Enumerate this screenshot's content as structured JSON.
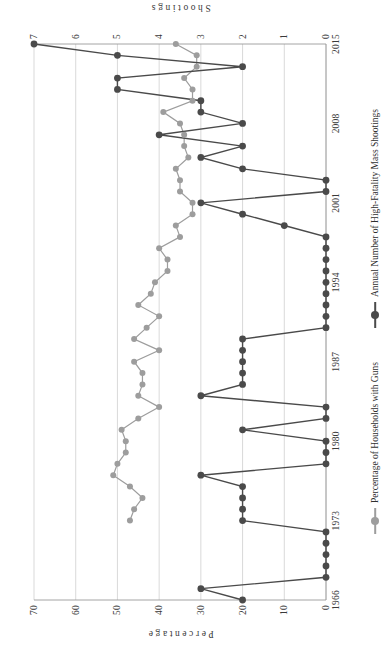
{
  "chart_data": {
    "type": "line",
    "title": "",
    "orientation": "rotated-90",
    "x": [
      1966,
      1967,
      1968,
      1969,
      1970,
      1971,
      1972,
      1973,
      1974,
      1975,
      1976,
      1977,
      1978,
      1979,
      1980,
      1981,
      1982,
      1983,
      1984,
      1985,
      1986,
      1987,
      1988,
      1989,
      1990,
      1991,
      1992,
      1993,
      1994,
      1995,
      1996,
      1997,
      1998,
      1999,
      2000,
      2001,
      2002,
      2003,
      2004,
      2005,
      2006,
      2007,
      2008,
      2009,
      2010,
      2011,
      2012,
      2013,
      2014,
      2015
    ],
    "xlabel": "",
    "xticks": [
      1966,
      1973,
      1980,
      1987,
      1994,
      2001,
      2008,
      2015
    ],
    "grid": true,
    "legend_position": "bottom",
    "series": [
      {
        "name": "Percentage of Households with Guns",
        "axis": "left",
        "color": "#9d9d9d",
        "marker": "circle",
        "ylabel": "Percentage",
        "ylim": [
          0,
          70
        ],
        "yticks": [
          0,
          10,
          20,
          30,
          40,
          50,
          60,
          70
        ],
        "values": [
          null,
          null,
          null,
          null,
          null,
          null,
          null,
          47,
          46,
          44,
          47,
          51,
          50,
          48,
          48,
          49,
          45,
          40,
          45,
          44,
          44,
          46,
          40,
          46,
          43,
          40,
          45,
          42,
          41,
          38,
          38,
          40,
          35,
          36,
          32,
          32,
          35,
          35,
          36,
          33,
          34,
          34,
          35,
          39,
          32,
          32,
          34,
          31,
          31,
          36
        ]
      },
      {
        "name": "Annual Number of High-Fatality Mass Shootings",
        "axis": "right",
        "color": "#4a4a4a",
        "marker": "circle",
        "ylabel": "Shootings",
        "ylim": [
          0,
          7
        ],
        "yticks": [
          0,
          1,
          2,
          3,
          4,
          5,
          6,
          7
        ],
        "values": [
          2,
          3,
          0,
          0,
          0,
          0,
          0,
          2,
          2,
          2,
          2,
          3,
          0,
          0,
          0,
          2,
          0,
          0,
          3,
          2,
          2,
          2,
          2,
          2,
          0,
          0,
          0,
          0,
          0,
          0,
          0,
          0,
          0,
          1,
          2,
          3,
          0,
          0,
          2,
          3,
          2,
          4,
          2,
          3,
          3,
          5,
          5,
          2,
          5,
          7
        ]
      }
    ]
  },
  "axes": {
    "left": {
      "title": "Percentage",
      "ticks": [
        "0",
        "10",
        "20",
        "30",
        "40",
        "50",
        "60",
        "70"
      ]
    },
    "right": {
      "title": "Shootings",
      "ticks": [
        "0",
        "1",
        "2",
        "3",
        "4",
        "5",
        "6",
        "7"
      ]
    },
    "bottom": {
      "ticks": [
        "1966",
        "1973",
        "1980",
        "1987",
        "1994",
        "2001",
        "2008",
        "2015"
      ]
    }
  },
  "legend": {
    "items": [
      {
        "label": "Percentage of Households with Guns",
        "color": "#9d9d9d"
      },
      {
        "label": "Annual Number of High-Fatality Mass Shootings",
        "color": "#4a4a4a"
      }
    ]
  },
  "colors": {
    "grid": "#cfcfcf",
    "axis": "#9a9a9a",
    "guns_line": "#9d9d9d",
    "shootings_line": "#4a4a4a",
    "text": "#3a3a3a",
    "background": "#ffffff"
  }
}
